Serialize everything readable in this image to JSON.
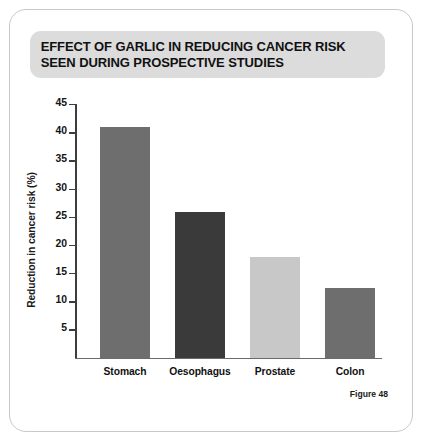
{
  "figure": {
    "title": "EFFECT OF GARLIC IN REDUCING CANCER RISK SEEN DURING PROSPECTIVE STUDIES",
    "caption": "Figure 48"
  },
  "chart_data": {
    "type": "bar",
    "title": "EFFECT OF GARLIC IN REDUCING CANCER RISK SEEN DURING PROSPECTIVE STUDIES",
    "xlabel": "",
    "ylabel": "Reduction in cancer risk (%)",
    "categories": [
      "Stomach",
      "Oesophagus",
      "Prostate",
      "Colon"
    ],
    "values": [
      41,
      26,
      18,
      12.5
    ],
    "bar_colors": [
      "#6e6e6e",
      "#3a3a3a",
      "#c8c8c8",
      "#6e6e6e"
    ],
    "ylim": [
      0,
      45
    ],
    "yticks": [
      5,
      10,
      15,
      20,
      25,
      30,
      35,
      40,
      45
    ],
    "ytick_labels": [
      "5",
      "10",
      "15",
      "20",
      "25",
      "30",
      "35",
      "40",
      "45"
    ],
    "grid": false,
    "legend": null
  },
  "colors": {
    "banner_bg": "#dcdcdc",
    "frame_border": "#c9c9c9",
    "axis": "#3d3d3d",
    "text": "#111111"
  }
}
